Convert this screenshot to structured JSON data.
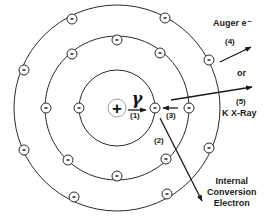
{
  "diagram": {
    "nucleus": {
      "symbol": "+",
      "cx": 117,
      "cy": 108,
      "r": 9
    },
    "gamma": {
      "symbol": "γ"
    },
    "shells": [
      {
        "name": "K",
        "r": 38
      },
      {
        "name": "L",
        "r": 72
      },
      {
        "name": "M",
        "r": 103
      }
    ],
    "electron_symbol": "-",
    "electrons": [
      {
        "shell": 0,
        "x": 79,
        "y": 108
      },
      {
        "shell": 0,
        "x": 155,
        "y": 108,
        "note": "ejected K electron"
      },
      {
        "shell": 1,
        "x": 46,
        "y": 108
      },
      {
        "shell": 1,
        "x": 72,
        "y": 54
      },
      {
        "shell": 1,
        "x": 117,
        "y": 40
      },
      {
        "shell": 1,
        "x": 160,
        "y": 53
      },
      {
        "shell": 1,
        "x": 189,
        "y": 108
      },
      {
        "shell": 1,
        "x": 68,
        "y": 160
      },
      {
        "shell": 1,
        "x": 117,
        "y": 176
      },
      {
        "shell": 1,
        "x": 166,
        "y": 159
      },
      {
        "shell": 2,
        "x": 72,
        "y": 19
      },
      {
        "shell": 2,
        "x": 165,
        "y": 18
      },
      {
        "shell": 2,
        "x": 24,
        "y": 70
      },
      {
        "shell": 2,
        "x": 209,
        "y": 60
      },
      {
        "shell": 2,
        "x": 24,
        "y": 150
      },
      {
        "shell": 2,
        "x": 74,
        "y": 197
      },
      {
        "shell": 2,
        "x": 167,
        "y": 194
      },
      {
        "shell": 2,
        "x": 209,
        "y": 148
      }
    ],
    "labels": {
      "step1": "(1)",
      "step2": "(2)",
      "step3": "(3)",
      "step4": "(4)",
      "step5": "(5)",
      "auger": "Auger e⁻",
      "or": "or",
      "kxray": "K X-Ray",
      "ic_line1": "Internal",
      "ic_line2": "Conversion",
      "ic_line3": "Electron"
    },
    "colors": {
      "line": "#2a2a2a",
      "background": "#ffffff"
    }
  }
}
